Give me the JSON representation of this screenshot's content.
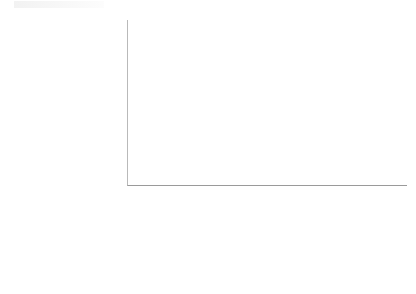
{
  "chart_data": {
    "type": "bar",
    "barmode": "stacked",
    "title": "",
    "xlabel": "",
    "ylabel": "Volume (in Billion USD)",
    "categories": [
      "2008",
      "2009",
      "2010",
      "2011",
      "2012",
      "2013",
      "2014"
    ],
    "ylim": [
      0,
      600
    ],
    "yticks": [
      0,
      100,
      200,
      300,
      400,
      500,
      600
    ],
    "ytick_labels": [
      "0",
      "100",
      "200",
      "300",
      "400",
      "500",
      "600"
    ],
    "grid": true,
    "legend_position": "data-table",
    "series": [
      {
        "name": "Total Assets Leasing Company",
        "color": "#a6a6a6",
        "stack_position": "bottom",
        "values": [
          14,
          23,
          61,
          66,
          122,
          162,
          277
        ]
      },
      {
        "name": "Total Assets Financial Leasing Company",
        "color": "#595959",
        "stack_position": "top",
        "values": [
          11,
          23,
          46,
          77,
          116,
          146,
          200
        ]
      }
    ],
    "totals": [
      25,
      46,
      107,
      143,
      238,
      308,
      477
    ]
  },
  "table": {
    "header": [
      "",
      "2008",
      "2009",
      "2010",
      "2011",
      "2012",
      "2013",
      "2014"
    ],
    "rows": [
      {
        "label_line1": "Total Assets Financial",
        "label_line2": "Leasing Company",
        "swatch_color": "#595959",
        "values": [
          "11",
          "23",
          "46",
          "77",
          "116",
          "146",
          "200"
        ]
      },
      {
        "label_line1": "Total Assets Leasing",
        "label_line2": "Company",
        "swatch_color": "#a6a6a6",
        "values": [
          "14",
          "23",
          "61",
          "66",
          "122",
          "162",
          "277"
        ]
      }
    ]
  }
}
